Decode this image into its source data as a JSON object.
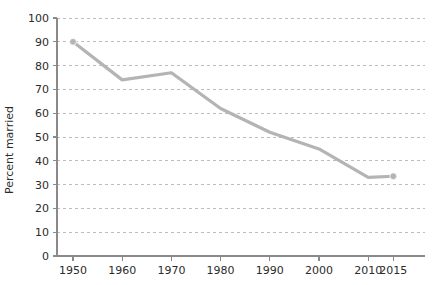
{
  "chart_data": {
    "type": "line",
    "title": "",
    "subtitle": "",
    "xlabel": "",
    "ylabel": "Percent married",
    "categories": [
      "1950",
      "1960",
      "1970",
      "1980",
      "1990",
      "2000",
      "2010",
      "2015"
    ],
    "x": [
      1950,
      1960,
      1970,
      1980,
      1990,
      2000,
      2010,
      2015
    ],
    "values": [
      90,
      74,
      77,
      62,
      52,
      45,
      33,
      33.5
    ],
    "series": [
      {
        "name": "Percent married",
        "values": [
          90,
          74,
          77,
          62,
          52,
          45,
          33,
          33.5
        ],
        "color": "#b4b4b4"
      }
    ],
    "ylim": [
      0,
      100
    ],
    "ytick_labels": [
      "0",
      "10",
      "20",
      "30",
      "40",
      "50",
      "60",
      "70",
      "80",
      "90",
      "100"
    ],
    "ytick_values": [
      0,
      10,
      20,
      30,
      40,
      50,
      60,
      70,
      80,
      90,
      100
    ],
    "xtick_labels": [
      "1950",
      "1960",
      "1970",
      "1980",
      "1990",
      "2000",
      "2010",
      "2015"
    ],
    "grid": "horizontal-dashed",
    "legend": "none",
    "marker": "circle",
    "line_color": "#b4b4b4",
    "grid_color": "#bdbdbd",
    "axis_color": "#8a8a8a",
    "text_color": "#2b2b2b",
    "background": "#ffffff"
  }
}
